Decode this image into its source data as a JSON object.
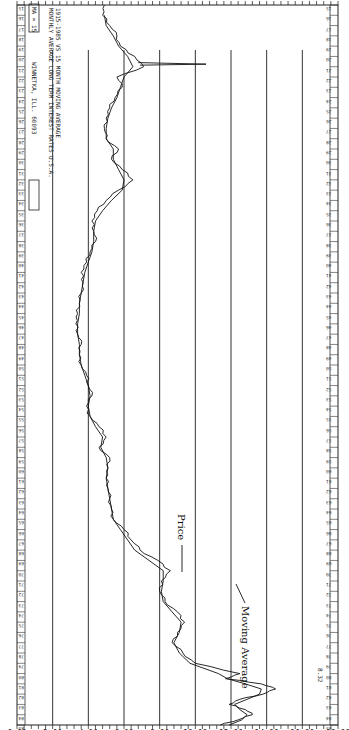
{
  "header": {
    "ma_label": "MA = 15",
    "company": "WINNETKA, ILL. 60093",
    "stamp_label": "",
    "title": "MONTHLY AVERAGE LONG TERM INTEREST RATES U.S.A.",
    "subtitle": "1915-1985 VS 15 MONTH MOVING AVERAGE"
  },
  "annotations": {
    "price_label": "Price",
    "ma_label": "Moving Average",
    "last_value": "8.32"
  },
  "chart_data": {
    "type": "line",
    "title": "MONTHLY AVERAGE LONG TERM INTEREST RATES U.S.A.",
    "subtitle": "1915-1985 VS 15 MONTH MOVING AVERAGE",
    "xlabel": "Year",
    "ylabel": "Interest Rate (%)",
    "ylim": [
      0,
      18
    ],
    "yticks": [
      "0.00",
      "2.00",
      "4.00",
      "6.00",
      "8.00",
      "10.00",
      "12.00",
      "14.00",
      "16.00",
      "18.00"
    ],
    "xlim": [
      1915,
      1985
    ],
    "grid": true,
    "legend": "annotations",
    "orientation": "rotated 90 degrees clockwise",
    "series": [
      {
        "name": "Price",
        "x": [
          1915,
          1916,
          1917,
          1918,
          1919,
          1920,
          1921,
          1922,
          1923,
          1924,
          1925,
          1926,
          1927,
          1928,
          1929,
          1930,
          1931,
          1932,
          1933,
          1934,
          1935,
          1936,
          1937,
          1938,
          1939,
          1940,
          1941,
          1942,
          1943,
          1944,
          1945,
          1946,
          1947,
          1948,
          1949,
          1950,
          1951,
          1952,
          1953,
          1954,
          1955,
          1956,
          1957,
          1958,
          1959,
          1960,
          1961,
          1962,
          1963,
          1964,
          1965,
          1966,
          1967,
          1968,
          1969,
          1970,
          1971,
          1972,
          1973,
          1974,
          1975,
          1976,
          1977,
          1978,
          1979,
          1980,
          1980.5,
          1981,
          1981.5,
          1982,
          1982.5,
          1983,
          1983.5,
          1984,
          1984.5,
          1985
        ],
        "values": [
          4.9,
          4.8,
          5.2,
          5.6,
          5.8,
          6.6,
          7.1,
          5.6,
          5.9,
          5.5,
          5.2,
          5.0,
          4.9,
          5.0,
          5.7,
          5.3,
          5.9,
          6.5,
          5.7,
          5.0,
          4.5,
          4.2,
          4.3,
          4.4,
          4.1,
          3.9,
          3.6,
          3.7,
          3.6,
          3.5,
          3.4,
          3.3,
          3.4,
          3.6,
          3.5,
          3.6,
          3.9,
          4.0,
          4.2,
          3.9,
          4.1,
          4.6,
          5.0,
          4.6,
          5.2,
          5.1,
          5.0,
          5.1,
          5.2,
          5.3,
          5.4,
          6.0,
          6.4,
          6.9,
          7.9,
          8.6,
          8.1,
          8.0,
          8.3,
          9.0,
          9.4,
          9.0,
          8.7,
          9.3,
          10.0,
          12.5,
          11.7,
          13.7,
          14.5,
          13.8,
          12.5,
          11.9,
          12.8,
          13.2,
          12.4,
          11.4
        ]
      },
      {
        "name": "Moving Average",
        "x": [
          1916,
          1917,
          1918,
          1919,
          1920,
          1921,
          1922,
          1923,
          1924,
          1925,
          1926,
          1927,
          1928,
          1929,
          1930,
          1931,
          1932,
          1933,
          1934,
          1935,
          1936,
          1937,
          1938,
          1939,
          1940,
          1941,
          1942,
          1943,
          1944,
          1945,
          1946,
          1947,
          1948,
          1949,
          1950,
          1951,
          1952,
          1953,
          1954,
          1955,
          1956,
          1957,
          1958,
          1959,
          1960,
          1961,
          1962,
          1963,
          1964,
          1965,
          1966,
          1967,
          1968,
          1969,
          1970,
          1971,
          1972,
          1973,
          1974,
          1975,
          1976,
          1977,
          1978,
          1979,
          1980,
          1980.5,
          1981,
          1981.5,
          1982,
          1982.5,
          1983,
          1983.5,
          1984,
          1984.5,
          1985
        ],
        "values": [
          4.9,
          5.0,
          5.4,
          5.7,
          6.2,
          6.5,
          6.0,
          5.8,
          5.6,
          5.3,
          5.1,
          5.0,
          5.0,
          5.4,
          5.4,
          5.7,
          6.0,
          5.9,
          5.3,
          4.8,
          4.4,
          4.3,
          4.3,
          4.2,
          4.0,
          3.8,
          3.7,
          3.6,
          3.5,
          3.5,
          3.4,
          3.4,
          3.5,
          3.5,
          3.6,
          3.8,
          4.0,
          4.1,
          4.0,
          4.1,
          4.4,
          4.8,
          4.7,
          5.0,
          5.1,
          5.0,
          5.1,
          5.2,
          5.3,
          5.4,
          5.8,
          6.2,
          6.6,
          7.4,
          8.2,
          8.2,
          8.1,
          8.2,
          8.7,
          9.2,
          9.1,
          8.8,
          9.1,
          9.7,
          11.3,
          11.8,
          12.8,
          13.7,
          13.6,
          12.9,
          12.2,
          12.5,
          12.9,
          12.6,
          11.9
        ]
      }
    ],
    "annotations": [
      {
        "text": "Price",
        "near_year": 1980,
        "near_value": 12.3
      },
      {
        "text": "Moving Average",
        "near_year": 1982,
        "near_value": 14.0
      },
      {
        "text": "8.32",
        "position": "right margin near end of series"
      }
    ]
  },
  "axis": {
    "value_ticks": [
      "18.00",
      "16.00",
      "14.00",
      "12.00",
      "10.00",
      "8.00",
      "6.00",
      "4.00",
      "2.00",
      "0.00"
    ]
  },
  "colors": {
    "background": "#ffffff",
    "ink": "#111111"
  }
}
